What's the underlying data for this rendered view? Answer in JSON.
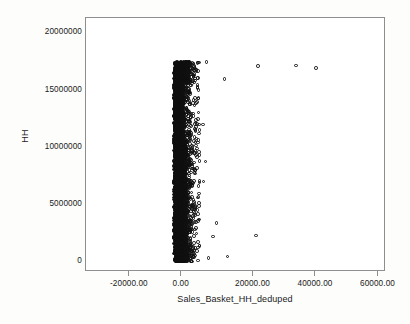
{
  "figure": {
    "background_color": "#fdfdfc",
    "plot_background_color": "#ffffff",
    "frame_color": "#8e8e8e",
    "marker_color": "#111111"
  },
  "chart_data": {
    "type": "scatter",
    "title": "",
    "subtitle": "",
    "xlabel": "Sales_Basket_HH_deduped",
    "ylabel": "HH",
    "xlim": [
      -28000,
      68000
    ],
    "ylim": [
      -900000,
      21300000
    ],
    "grid": false,
    "legend_position": "none",
    "xticks": [
      -20000,
      0,
      20000,
      40000,
      60000
    ],
    "xtick_labels": [
      "-20000.00",
      "0.00",
      "20000.00",
      "40000.00",
      "60000.00"
    ],
    "yticks": [
      0,
      5000000,
      10000000,
      15000000,
      20000000
    ],
    "ytick_labels": [
      "0",
      "5000000",
      "10000000",
      "15000000",
      "20000000"
    ],
    "marker": "open-circle",
    "outliers": [
      {
        "x": 27000,
        "y": 17100000
      },
      {
        "x": 39200,
        "y": 17150000
      },
      {
        "x": 45600,
        "y": 16950000
      },
      {
        "x": 16300,
        "y": 15950000
      },
      {
        "x": 10500,
        "y": 17450000
      },
      {
        "x": 9400,
        "y": 12000000
      },
      {
        "x": 10200,
        "y": 8750000
      },
      {
        "x": 9600,
        "y": 7000000
      },
      {
        "x": 8300,
        "y": 3700000
      },
      {
        "x": 13700,
        "y": 3400000
      },
      {
        "x": 26400,
        "y": 2300000
      },
      {
        "x": 12600,
        "y": 2200000
      },
      {
        "x": 11200,
        "y": 300000
      },
      {
        "x": 17300,
        "y": 450000
      }
    ],
    "series": [
      {
        "name": "HH vs Sales_Basket_HH_deduped",
        "n_points_approx": 3000,
        "cluster_x_range": [
          0,
          6500
        ],
        "cluster_y_range": [
          0,
          17500000
        ]
      }
    ]
  }
}
